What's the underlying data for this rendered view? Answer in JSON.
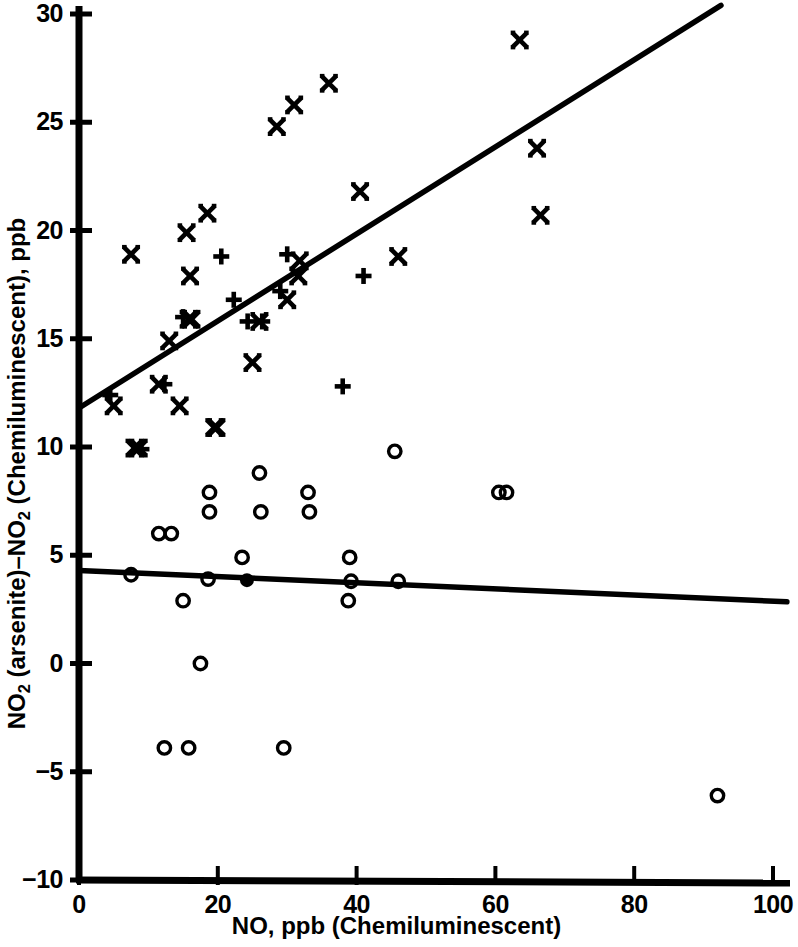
{
  "chart_data": {
    "type": "scatter",
    "title": "",
    "xlabel": "NO, ppb (Chemiluminescent)",
    "ylabel_parts": [
      "NO",
      "2",
      " (arsenite)–NO",
      "2",
      " (Chemiluminescent), ppb"
    ],
    "ylabel": "NO2 (arsenite)-NO2 (Chemiluminescent), ppb",
    "xlim": [
      0,
      102
    ],
    "ylim": [
      -10,
      30.5
    ],
    "xticks": [
      0,
      20,
      40,
      60,
      80,
      100
    ],
    "xtick_labels": [
      "0",
      "20",
      "40",
      "60",
      "80",
      "100"
    ],
    "yticks": [
      -10,
      -5,
      0,
      5,
      10,
      15,
      20,
      25,
      30
    ],
    "ytick_labels": [
      "−10",
      "−5",
      "0",
      "5",
      "10",
      "15",
      "20",
      "25",
      "30"
    ],
    "grid": false,
    "legend": null,
    "marker_color": "#000000",
    "line_color": "#000000",
    "series": [
      {
        "name": "cross-x-series",
        "marker": "x",
        "points": [
          [
            5.0,
            11.9
          ],
          [
            7.5,
            18.9
          ],
          [
            8.0,
            9.95
          ],
          [
            8.6,
            9.95
          ],
          [
            11.5,
            12.9
          ],
          [
            13.0,
            14.9
          ],
          [
            14.5,
            11.9
          ],
          [
            15.5,
            19.9
          ],
          [
            15.8,
            15.9
          ],
          [
            16.2,
            15.9
          ],
          [
            16.0,
            17.9
          ],
          [
            18.5,
            20.8
          ],
          [
            19.5,
            10.9
          ],
          [
            19.8,
            10.9
          ],
          [
            25.0,
            13.9
          ],
          [
            26.0,
            15.8
          ],
          [
            28.5,
            24.8
          ],
          [
            30.0,
            16.8
          ],
          [
            31.0,
            25.8
          ],
          [
            31.6,
            17.9
          ],
          [
            31.8,
            18.6
          ],
          [
            36.0,
            26.8
          ],
          [
            40.5,
            21.8
          ],
          [
            46.0,
            18.8
          ],
          [
            63.5,
            28.8
          ],
          [
            66.0,
            23.8
          ],
          [
            66.5,
            20.7
          ]
        ]
      },
      {
        "name": "plus-series",
        "marker": "+",
        "points": [
          [
            4.5,
            12.4
          ],
          [
            12.3,
            12.9
          ],
          [
            15.0,
            16.0
          ],
          [
            20.5,
            18.8
          ],
          [
            22.3,
            16.8
          ],
          [
            24.3,
            15.8
          ],
          [
            26.4,
            15.8
          ],
          [
            29.0,
            17.2
          ],
          [
            30.0,
            18.9
          ],
          [
            38.0,
            12.8
          ],
          [
            41.0,
            17.9
          ],
          [
            9.0,
            9.9
          ]
        ]
      },
      {
        "name": "open-circle-series",
        "marker": "o",
        "points": [
          [
            7.5,
            4.1
          ],
          [
            11.5,
            6.0
          ],
          [
            13.3,
            6.0
          ],
          [
            12.3,
            -3.9
          ],
          [
            15.8,
            -3.9
          ],
          [
            15.0,
            2.9
          ],
          [
            17.5,
            0.0
          ],
          [
            18.8,
            7.9
          ],
          [
            18.6,
            3.9
          ],
          [
            18.8,
            7.0
          ],
          [
            23.5,
            4.9
          ],
          [
            26.0,
            8.8
          ],
          [
            26.2,
            7.0
          ],
          [
            29.5,
            -3.9
          ],
          [
            33.0,
            7.9
          ],
          [
            33.2,
            7.0
          ],
          [
            39.0,
            4.9
          ],
          [
            39.2,
            3.8
          ],
          [
            38.8,
            2.9
          ],
          [
            45.5,
            9.8
          ],
          [
            46.0,
            3.8
          ],
          [
            60.5,
            7.9
          ],
          [
            61.6,
            7.9
          ],
          [
            92.0,
            -6.1
          ]
        ]
      },
      {
        "name": "filled-circle-series",
        "marker": "filled-o",
        "points": [
          [
            24.2,
            3.85
          ]
        ]
      }
    ],
    "fit_lines": [
      {
        "name": "upper-regression-line",
        "x0": 0.0,
        "y0": 11.8,
        "x1": 92.5,
        "y1": 30.4
      },
      {
        "name": "lower-regression-line",
        "x0": 0.0,
        "y0": 4.3,
        "x1": 102.0,
        "y1": 2.85
      }
    ]
  }
}
